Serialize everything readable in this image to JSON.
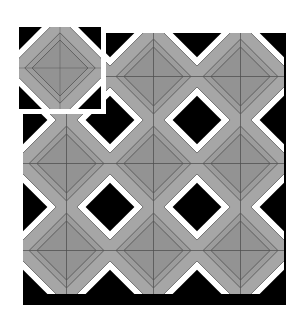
{
  "figure": {
    "kind": "tiling-pattern-illustration",
    "background_color": "#ffffff"
  },
  "palette": {
    "black": "#000000",
    "white": "#ffffff",
    "gray_outer": "#a6a6a6",
    "gray_mid": "#9c9c9c",
    "gray_inner": "#939393",
    "line": "#4a4a4a",
    "frame": "#ffffff"
  },
  "inset": {
    "label": "single tile",
    "x": 14,
    "y": 22,
    "width": 92,
    "height": 92,
    "frame_width": 5,
    "tile_count": 1
  },
  "grid": {
    "label": "tiled array",
    "x": 23,
    "y": 33,
    "width": 263,
    "height": 272,
    "tile_size": 87,
    "columns": 3,
    "rows": 3,
    "tile_count": 9
  },
  "tile": {
    "name": "kite-and-dart tile",
    "size": 100,
    "quadrants": 4,
    "symmetry": "4-fold mirror",
    "regions": [
      {
        "name": "corner-triangle",
        "color": "#000000"
      },
      {
        "name": "white-chevron-band",
        "color": "#ffffff"
      },
      {
        "name": "gray-outer-band",
        "color": "#a6a6a6"
      },
      {
        "name": "gray-mid-band",
        "color": "#9c9c9c"
      },
      {
        "name": "central-diamond",
        "color": "#939393"
      },
      {
        "name": "edge-spike",
        "color": "#000000"
      }
    ]
  }
}
